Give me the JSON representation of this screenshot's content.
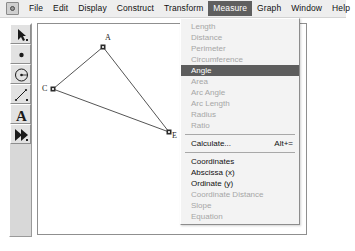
{
  "app": {
    "icon": "app-logo-icon"
  },
  "menubar": {
    "items": [
      {
        "label": "File",
        "active": false
      },
      {
        "label": "Edit",
        "active": false
      },
      {
        "label": "Display",
        "active": false
      },
      {
        "label": "Construct",
        "active": false
      },
      {
        "label": "Transform",
        "active": false
      },
      {
        "label": "Measure",
        "active": true
      },
      {
        "label": "Graph",
        "active": false
      },
      {
        "label": "Window",
        "active": false
      },
      {
        "label": "Help",
        "active": false
      }
    ]
  },
  "toolbar": {
    "tools": [
      {
        "name": "arrow-select-tool",
        "icon": "arrow-icon"
      },
      {
        "name": "point-tool",
        "icon": "point-icon"
      },
      {
        "name": "compass-circle-tool",
        "icon": "circle-icon"
      },
      {
        "name": "straightedge-tool",
        "icon": "line-segment-icon"
      },
      {
        "name": "text-tool",
        "icon": "letter-a-icon"
      },
      {
        "name": "custom-tool",
        "icon": "double-arrow-icon"
      }
    ]
  },
  "menu": {
    "title": "Measure",
    "items": [
      {
        "label": "Length",
        "state": "disabled",
        "accel": ""
      },
      {
        "label": "Distance",
        "state": "disabled",
        "accel": ""
      },
      {
        "label": "Perimeter",
        "state": "disabled",
        "accel": ""
      },
      {
        "label": "Circumference",
        "state": "disabled",
        "accel": ""
      },
      {
        "label": "Angle",
        "state": "selected",
        "accel": ""
      },
      {
        "label": "Area",
        "state": "disabled",
        "accel": ""
      },
      {
        "label": "Arc Angle",
        "state": "disabled",
        "accel": ""
      },
      {
        "label": "Arc Length",
        "state": "disabled",
        "accel": ""
      },
      {
        "label": "Radius",
        "state": "disabled",
        "accel": ""
      },
      {
        "label": "Ratio",
        "state": "disabled",
        "accel": ""
      },
      {
        "label": "__separator__",
        "state": "separator",
        "accel": ""
      },
      {
        "label": "Calculate...",
        "state": "enabled",
        "accel": "Alt+="
      },
      {
        "label": "__separator__",
        "state": "separator",
        "accel": ""
      },
      {
        "label": "Coordinates",
        "state": "enabled",
        "accel": ""
      },
      {
        "label": "Abscissa (x)",
        "state": "enabled",
        "accel": ""
      },
      {
        "label": "Ordinate (y)",
        "state": "enabled",
        "accel": ""
      },
      {
        "label": "Coordinate Distance",
        "state": "disabled",
        "accel": ""
      },
      {
        "label": "Slope",
        "state": "disabled",
        "accel": ""
      },
      {
        "label": "Equation",
        "state": "disabled",
        "accel": ""
      }
    ]
  },
  "sketch": {
    "points": [
      {
        "label": "A",
        "x": 102,
        "y": 46,
        "label_dx": 2,
        "label_dy": -11
      },
      {
        "label": "C",
        "x": 52,
        "y": 88,
        "label_dx": -10,
        "label_dy": -4
      },
      {
        "label": "E",
        "x": 168,
        "y": 131,
        "label_dx": 3,
        "label_dy": 1
      }
    ],
    "segments": [
      {
        "from": "A",
        "to": "C"
      },
      {
        "from": "A",
        "to": "E"
      },
      {
        "from": "C",
        "to": "E"
      }
    ],
    "stroke_color": "#555555"
  }
}
